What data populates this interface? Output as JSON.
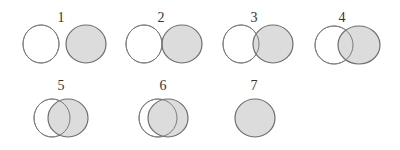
{
  "diagram": {
    "colors": {
      "white_fill": "#ffffff",
      "gray_fill": "#dcdcdc",
      "outline": "#7a7a7a"
    },
    "stages": [
      {
        "label": "1",
        "lx": 61,
        "ly": 22,
        "white": {
          "cx": 41,
          "cy": 44,
          "rx": 18,
          "ry": 19
        },
        "gray": {
          "cx": 86,
          "cy": 44,
          "rx": 20,
          "ry": 19
        }
      },
      {
        "label": "2",
        "lx": 161,
        "ly": 22,
        "white": {
          "cx": 144,
          "cy": 44,
          "rx": 18,
          "ry": 19
        },
        "gray": {
          "cx": 182,
          "cy": 44,
          "rx": 20,
          "ry": 19
        }
      },
      {
        "label": "3",
        "lx": 254,
        "ly": 22,
        "white": {
          "cx": 241,
          "cy": 44,
          "rx": 18,
          "ry": 19
        },
        "gray": {
          "cx": 273,
          "cy": 44,
          "rx": 20,
          "ry": 19
        }
      },
      {
        "label": "4",
        "lx": 342,
        "ly": 22,
        "white": {
          "cx": 334,
          "cy": 45,
          "rx": 19,
          "ry": 19
        },
        "gray": {
          "cx": 359,
          "cy": 45,
          "rx": 21,
          "ry": 19
        }
      },
      {
        "label": "5",
        "lx": 61,
        "ly": 90,
        "white": {
          "cx": 52,
          "cy": 118,
          "rx": 18,
          "ry": 19
        },
        "gray": {
          "cx": 68,
          "cy": 118,
          "rx": 20,
          "ry": 19
        }
      },
      {
        "label": "6",
        "lx": 163,
        "ly": 90,
        "white": {
          "cx": 158,
          "cy": 118,
          "rx": 19,
          "ry": 19
        },
        "gray": {
          "cx": 168,
          "cy": 118,
          "rx": 20,
          "ry": 19
        }
      },
      {
        "label": "7",
        "lx": 254,
        "ly": 90,
        "white": null,
        "gray": {
          "cx": 255,
          "cy": 118,
          "rx": 20,
          "ry": 19
        }
      }
    ]
  }
}
